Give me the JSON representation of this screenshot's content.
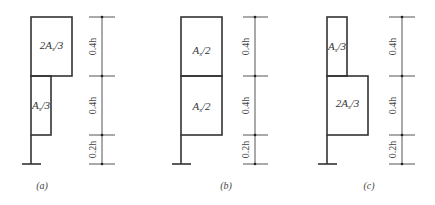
{
  "figure": {
    "panels": [
      {
        "id": "a",
        "caption": "(a)",
        "top_region_label": "2As/3",
        "bottom_region_label": "As/3",
        "top_region_text": {
          "coef": "2",
          "base": "A",
          "sub": "s",
          "den": "/3"
        },
        "bottom_region_text": {
          "coef": "",
          "base": "A",
          "sub": "s",
          "den": "/3"
        },
        "dimensions": [
          "0.4h",
          "0.4h",
          "0.2h"
        ]
      },
      {
        "id": "b",
        "caption": "(b)",
        "top_region_label": "As/2",
        "bottom_region_label": "As/2",
        "top_region_text": {
          "coef": "",
          "base": "A",
          "sub": "s",
          "den": "/2"
        },
        "bottom_region_text": {
          "coef": "",
          "base": "A",
          "sub": "s",
          "den": "/2"
        },
        "dimensions": [
          "0.4h",
          "0.4h",
          "0.2h"
        ]
      },
      {
        "id": "c",
        "caption": "(c)",
        "top_region_label": "As/3",
        "bottom_region_label": "2As/3",
        "top_region_text": {
          "coef": "",
          "base": "A",
          "sub": "s",
          "den": "/3"
        },
        "bottom_region_text": {
          "coef": "2",
          "base": "A",
          "sub": "s",
          "den": "/3"
        },
        "dimensions": [
          "0.4h",
          "0.4h",
          "0.2h"
        ]
      }
    ],
    "colors": {
      "stroke": "#333333",
      "background": "#ffffff"
    }
  }
}
